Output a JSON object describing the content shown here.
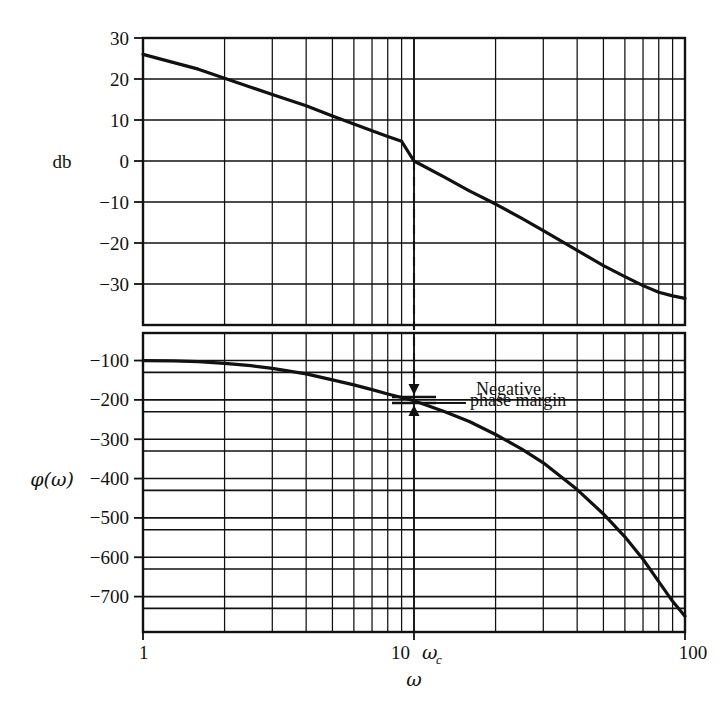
{
  "figure": {
    "background_color": "#ffffff",
    "ink_color": "#111111",
    "curve_color": "#111111"
  },
  "axes": {
    "x": {
      "label": "ω",
      "scale": "log",
      "min": 1,
      "max": 100,
      "tick_labels": [
        "1",
        "10",
        "100"
      ],
      "tick_values": [
        1,
        10,
        100
      ],
      "crossover_label": "ω",
      "crossover_subscript": "c",
      "crossover_value": 10
    },
    "magnitude": {
      "label": "db",
      "min": -40,
      "max": 30,
      "tick_labels": [
        "30",
        "20",
        "10",
        "0",
        "−10",
        "−20",
        "−30"
      ],
      "tick_values": [
        30,
        20,
        10,
        0,
        -10,
        -20,
        -30
      ]
    },
    "phase": {
      "label": "φ(ω)",
      "min": -790,
      "max": -30,
      "tick_labels": [
        "−100",
        "−200",
        "−300",
        "−400",
        "−500",
        "−600",
        "−700"
      ],
      "tick_values": [
        -100,
        -200,
        -300,
        -400,
        -500,
        -600,
        -700
      ]
    }
  },
  "annotations": {
    "negative_phase_margin": {
      "line1": "Negative",
      "line2": "phase margin",
      "leader_x_omega": 10,
      "upper_bracket_phase": -185,
      "lower_bracket_phase": -218
    },
    "crossover_dashed_line": {
      "from_db": 0,
      "to_phase": -190,
      "omega": 10
    }
  },
  "chart_data": {
    "type": "line",
    "title": "",
    "xlabel": "ω",
    "ylabel": "db",
    "xscale": "log",
    "xlim": [
      1,
      100
    ],
    "grid": true,
    "legend": "none",
    "series": [
      {
        "name": "magnitude",
        "unit": "db",
        "ylim": [
          -40,
          30
        ],
        "x": [
          1,
          1.3,
          1.6,
          2,
          2.5,
          3,
          4,
          5,
          6,
          7,
          8,
          9,
          10,
          13,
          16,
          20,
          25,
          30,
          40,
          50,
          60,
          70,
          80,
          90,
          100
        ],
        "y": [
          26.0,
          24.0,
          22.4,
          20.2,
          18.0,
          16.2,
          13.5,
          11.0,
          9.0,
          7.4,
          6.0,
          4.8,
          0.0,
          -4.0,
          -7.3,
          -10.5,
          -14.0,
          -17.0,
          -21.8,
          -25.5,
          -28.2,
          -30.4,
          -32.0,
          -32.9,
          -33.5
        ],
        "reading": "starts at 26 db at w=1, crosses 20 db near w=2, 10 db near w=4.8, 0 db at w=10 (crossover), ends near -33.5 db at w=100"
      },
      {
        "name": "phase",
        "unit": "degrees",
        "ylim": [
          -790,
          -30
        ],
        "x": [
          1,
          1.3,
          1.6,
          2,
          2.5,
          3,
          4,
          5,
          6,
          7,
          8,
          9,
          10,
          13,
          16,
          20,
          25,
          30,
          40,
          50,
          60,
          70,
          80,
          90,
          100
        ],
        "y": [
          -100,
          -101,
          -103,
          -107,
          -113,
          -120,
          -134,
          -149,
          -162,
          -174,
          -185,
          -194,
          -202,
          -230,
          -255,
          -288,
          -325,
          -360,
          -428,
          -490,
          -548,
          -605,
          -662,
          -712,
          -750
        ],
        "reading": "flat near -100 deg at low w, passes -200 deg at w=10 (crossover), falls steeply to about -750 deg at w=100"
      }
    ]
  }
}
